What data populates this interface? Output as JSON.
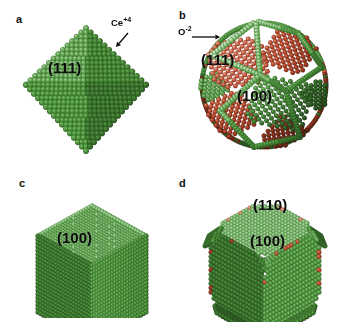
{
  "figure": {
    "kind": "ceria-nanocrystal-models",
    "background": "#ffffff",
    "width": 349,
    "height": 328
  },
  "colors": {
    "cerium_green": "#4f9c3d",
    "cerium_green_light": "#74bb5e",
    "cerium_green_dark": "#2f6b26",
    "oxygen_red": "#c0492b",
    "oxygen_red_light": "#d9714e",
    "oxygen_red_dark": "#8d3218",
    "label_text": "#0b0b0b",
    "background": "#ffffff"
  },
  "legend": {
    "cerium": {
      "label": "Ce",
      "charge": "+4",
      "color": "#4f9c3d"
    },
    "oxygen": {
      "label": "O",
      "charge": "-2",
      "color": "#c0492b"
    }
  },
  "panels": [
    {
      "id": "a",
      "label": "a",
      "shape": "octahedron",
      "description": "Octahedral ceria nanocrystal bounded entirely by {111} facets, all-green cerium surface termination",
      "facet_labels": [
        {
          "text": "(111)",
          "x": 48,
          "y": 60,
          "font_size": 15
        }
      ],
      "annotations": [
        {
          "name": "cerium-ion-annotation",
          "text": "Ce",
          "charge": "+4",
          "label_x": 111,
          "label_y": 18,
          "arrow": {
            "x1": 128,
            "y1": 33,
            "x2": 116,
            "y2": 47
          }
        }
      ],
      "surface_species": [
        "Ce+4"
      ]
    },
    {
      "id": "b",
      "label": "b",
      "shape": "truncated-octahedron-polyhedron",
      "description": "Polyhedral ceria nanocrystal exposing both {111} and {100} facets; {111} facets terminate in oxygen (red) while the {100} facet shown is cerium terminated (green)",
      "facet_labels": [
        {
          "text": "(111)",
          "x": 26,
          "y": 52,
          "font_size": 15
        },
        {
          "text": "(100)",
          "x": 62,
          "y": 88,
          "font_size": 15
        }
      ],
      "annotations": [
        {
          "name": "oxygen-ion-annotation",
          "text": "O",
          "charge": "-2",
          "label_x": 3,
          "label_y": 27,
          "arrow": {
            "x1": 17,
            "y1": 37,
            "x2": 45,
            "y2": 37
          }
        }
      ],
      "surface_species": [
        "O-2",
        "Ce+4"
      ]
    },
    {
      "id": "c",
      "label": "c",
      "shape": "cube",
      "description": "Cubic ceria nanocrystal bounded entirely by {100} facets, all-green cerium surface termination",
      "facet_labels": [
        {
          "text": "(100)",
          "x": 57,
          "y": 66,
          "font_size": 15
        }
      ],
      "annotations": [],
      "surface_species": [
        "Ce+4"
      ]
    },
    {
      "id": "d",
      "label": "d",
      "shape": "truncated-cube",
      "description": "Truncated-cube ceria nanocrystal exposing {100} and {110} facets, cerium terminated with sparse oxygen at edges",
      "facet_labels": [
        {
          "text": "(110)",
          "x": 78,
          "y": 33,
          "font_size": 15
        },
        {
          "text": "(100)",
          "x": 75,
          "y": 69,
          "font_size": 15
        }
      ],
      "annotations": [],
      "surface_species": [
        "Ce+4"
      ]
    }
  ]
}
